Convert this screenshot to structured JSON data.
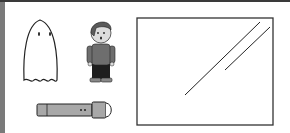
{
  "scene": {
    "description": "Illustration panel with a ghost, a boy, a flashlight, and a glass window pane",
    "items": [
      {
        "name": "ghost",
        "label": "Ghost"
      },
      {
        "name": "boy",
        "label": "Boy"
      },
      {
        "name": "flashlight",
        "label": "Flashlight"
      },
      {
        "name": "window-pane",
        "label": "Glass window"
      }
    ]
  },
  "colors": {
    "frame_left": "#7a7a7a",
    "frame_top": "#3a3a3a",
    "outline": "#222222",
    "shirt": "#6e6e6e",
    "pants": "#1e1e1e",
    "hair": "#5a5a5a",
    "skin": "#dcdcdc",
    "flashlight_body": "#a8a8a8",
    "background": "#ffffff"
  }
}
